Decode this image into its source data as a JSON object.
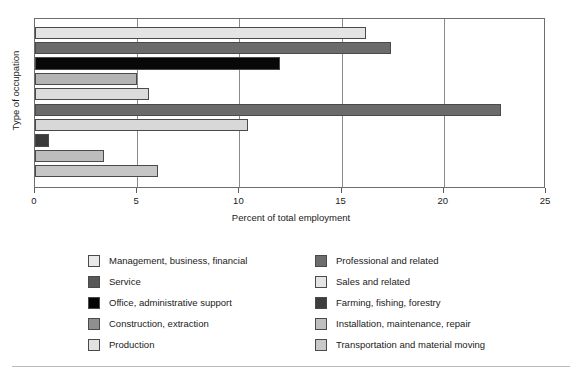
{
  "chart_data": {
    "type": "bar",
    "orientation": "horizontal",
    "title": "",
    "xlabel": "Percent of total employment",
    "ylabel": "Type of occupation",
    "xlim": [
      0,
      25
    ],
    "xticks": [
      0,
      5,
      10,
      15,
      20,
      25
    ],
    "xtick_labels": [
      "0",
      "5",
      "10",
      "15",
      "20",
      "25"
    ],
    "yticks": [],
    "ytick_labels": [],
    "grid": true,
    "legend_position": "bottom",
    "categories": [
      "Management, business, financial",
      "Professional and related",
      "Service",
      "Sales and related",
      "Office, administrative support",
      "Farming, fishing, forestry",
      "Construction, extraction",
      "Installation, maintenance, repair",
      "Production",
      "Transportation and material moving"
    ],
    "values": [
      16.2,
      17.4,
      12.0,
      5.0,
      5.6,
      22.8,
      10.4,
      0.7,
      3.4,
      6.0
    ],
    "bars": [
      {
        "label": "Management, business, financial",
        "value": 16.2,
        "color": "#e4e4e4"
      },
      {
        "label": "Professional and related",
        "value": 17.4,
        "color": "#6b6b6b"
      },
      {
        "label": "Service",
        "value": 12.0,
        "color": "#080808"
      },
      {
        "label": "Sales and related",
        "value": 5.0,
        "color": "#b4b4b4"
      },
      {
        "label": "Office, administrative support",
        "value": 5.6,
        "color": "#dcdcdc"
      },
      {
        "label": "Farming, fishing, forestry",
        "value": 22.8,
        "color": "#6b6b6b"
      },
      {
        "label": "Construction, extraction",
        "value": 10.4,
        "color": "#d8d8d8"
      },
      {
        "label": "Installation, maintenance, repair",
        "value": 0.7,
        "color": "#3a3a3a"
      },
      {
        "label": "Production",
        "value": 3.4,
        "color": "#bdbdbd"
      },
      {
        "label": "Transportation and material moving",
        "value": 6.0,
        "color": "#c6c6c6"
      }
    ]
  },
  "axis": {
    "x_title": "Percent of total employment",
    "y_title": "Type of occupation",
    "x_tick_labels": [
      "0",
      "5",
      "10",
      "15",
      "20",
      "25"
    ]
  },
  "legend": {
    "left_column": [
      {
        "label": "Management, business, financial",
        "color": "#e9e9e9"
      },
      {
        "label": "Service",
        "color": "#585858"
      },
      {
        "label": "Office, administrative support",
        "color": "#050505"
      },
      {
        "label": "Construction, extraction",
        "color": "#8f8f8f"
      },
      {
        "label": "Production",
        "color": "#e2e2e2"
      }
    ],
    "right_column": [
      {
        "label": "Professional and related",
        "color": "#6d6d6d"
      },
      {
        "label": "Sales and related",
        "color": "#e4e4e4"
      },
      {
        "label": "Farming, fishing, forestry",
        "color": "#3d3d3d"
      },
      {
        "label": "Installation, maintenance, repair",
        "color": "#bfbfbf"
      },
      {
        "label": "Transportation and material moving",
        "color": "#c9c9c9"
      }
    ]
  },
  "colors": {
    "frame": "#6e6e6e",
    "gridline": "#8a8a8a",
    "bar_outline": "#4a4a4a",
    "text": "#1a1a1a",
    "rule": "#b9b9b9"
  }
}
